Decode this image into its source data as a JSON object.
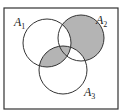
{
  "diagram": {
    "type": "venn",
    "sets": [
      {
        "name": "A",
        "subscript": "1"
      },
      {
        "name": "A",
        "subscript": "2"
      },
      {
        "name": "A",
        "subscript": "3"
      }
    ],
    "shaded_regions": [
      "A2 only",
      "A1∩A3 (not A2)",
      "A1∩A2∩A3"
    ],
    "colors": {
      "shade": "#b4b4b4",
      "stroke": "#333333",
      "background": "#ffffff"
    }
  }
}
